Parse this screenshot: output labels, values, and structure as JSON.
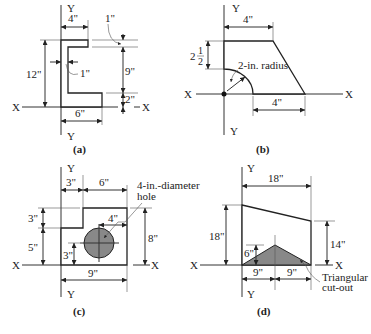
{
  "figures": [
    {
      "caption": "(a)",
      "axis_x": "X",
      "axis_y_top": "Y",
      "axis_y_bottom": "Y",
      "dims": {
        "top_width": "4\"",
        "bottom_width": "6\"",
        "height": "12\"",
        "web": "1\"",
        "top_flange": "1\"",
        "inner": "9\"",
        "bottom_flange": "2\""
      }
    },
    {
      "caption": "(b)",
      "axis_x_left": "X",
      "axis_x_right": "X",
      "axis_y_top": "Y",
      "axis_y_bottom": "Y",
      "dims": {
        "top_width": "4\"",
        "bottom_width": "4\"",
        "left_height_whole": "2",
        "left_height_num": "1",
        "left_height_den": "2",
        "radius": "2-in. radius"
      }
    },
    {
      "caption": "(c)",
      "axis_x_left": "X",
      "axis_x_right": "X",
      "axis_y_top": "Y",
      "axis_y_bottom": "Y",
      "dims": {
        "step_width": "3\"",
        "top_width": "6\"",
        "step_height": "3\"",
        "lower_height": "5\"",
        "right_height": "8\"",
        "bottom_width": "9\"",
        "hole_x": "4\"",
        "hole_y": "3\"",
        "hole_label_1": "4-in.-diameter",
        "hole_label_2": "hole"
      }
    },
    {
      "caption": "(d)",
      "axis_x_left": "X",
      "axis_x_right": "X",
      "axis_y_top": "Y",
      "axis_y_bottom": "Y",
      "dims": {
        "top_width": "18\"",
        "left_height": "18\"",
        "right_height": "14\"",
        "tri_height": "6\"",
        "half_left": "9\"",
        "half_right": "9\"",
        "cutout_1": "Triangular",
        "cutout_2": "cut-out"
      }
    }
  ]
}
